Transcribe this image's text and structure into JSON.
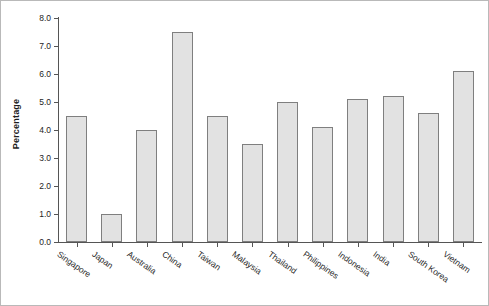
{
  "chart_data": {
    "type": "bar",
    "title": "",
    "xlabel": "",
    "ylabel": "Percentage",
    "categories": [
      "Singapore",
      "Japan",
      "Australia",
      "China",
      "Taiwan",
      "Malaysia",
      "Thailand",
      "Philippines",
      "Indonesia",
      "India",
      "South Korea",
      "Vietnam"
    ],
    "values": [
      4.5,
      1.0,
      4.0,
      7.5,
      4.5,
      3.5,
      5.0,
      4.1,
      5.1,
      5.2,
      4.6,
      6.1
    ],
    "ylim": [
      0.0,
      8.0
    ],
    "ytick_labels": [
      "0.0",
      "1.0",
      "2.0",
      "3.0",
      "4.0",
      "5.0",
      "6.0",
      "7.0",
      "8.0"
    ],
    "ytick_values": [
      0.0,
      1.0,
      2.0,
      3.0,
      4.0,
      5.0,
      6.0,
      7.0,
      8.0
    ],
    "grid": false,
    "legend": false,
    "legend_position": "none",
    "bar_fill_color": "#e2e2e2",
    "bar_edge_color": "#7f7f7f",
    "axis_color": "#555555",
    "text_color": "#1d1d1d",
    "background_color": "#ffffff",
    "xtick_label_rotation": 35
  }
}
